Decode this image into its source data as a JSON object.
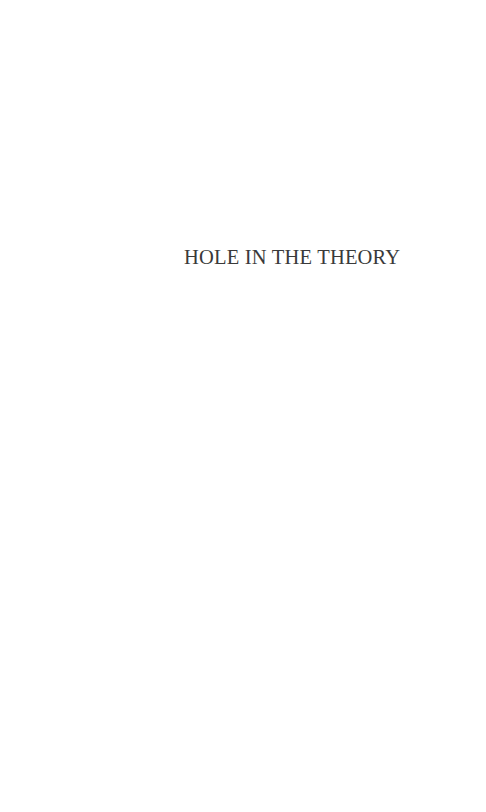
{
  "page": {
    "half_title": "HOLE IN THE THEORY"
  }
}
